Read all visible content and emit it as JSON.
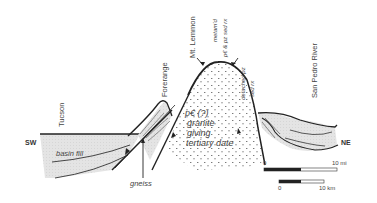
{
  "diagram": {
    "type": "geologic-cross-section",
    "direction_labels": {
      "left": "SW",
      "right": "NE"
    },
    "place_labels": {
      "tucson": "Tucson",
      "forerange": "Forerange",
      "mt_lemmon": "Mt. Lemmon",
      "san_pedro": "San Pedro River"
    },
    "unit_labels": {
      "metamorphosed_line1": "metam'd",
      "metamorphosed_line2": "p€ & pz sed rx",
      "detached_line1": "detached pz",
      "detached_line2": "sed rx",
      "core_line1": "p€ (?)",
      "core_line2": "granite",
      "core_line3": "giving",
      "core_line4": "tertiary date",
      "basin_fill": "basin fill",
      "gneiss": "gneiss"
    },
    "scale_bars": {
      "miles": {
        "start": "0",
        "end": "10 mi"
      },
      "km": {
        "start": "0",
        "end": "10 km"
      }
    },
    "colors": {
      "line": "#222222",
      "fill_basin": "#e6e6e6",
      "stipple": "#777777"
    }
  }
}
